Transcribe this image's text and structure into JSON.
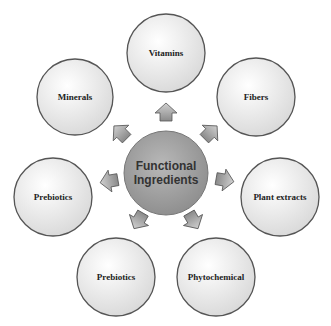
{
  "center": {
    "line1": "Functional",
    "line2": "Ingredients"
  },
  "nodes": [
    {
      "label": "Vitamins"
    },
    {
      "label": "Fibers"
    },
    {
      "label": "Plant extracts"
    },
    {
      "label": "Phytochemical"
    },
    {
      "label": "Prebiotics"
    },
    {
      "label": "Prebiotics"
    },
    {
      "label": "Minerals"
    }
  ],
  "colors": {
    "node_fill": "#f2f2f2",
    "node_stroke": "#555555",
    "center_fill": "#a8a8a8",
    "arrow_fill": "#9a9a9a"
  }
}
